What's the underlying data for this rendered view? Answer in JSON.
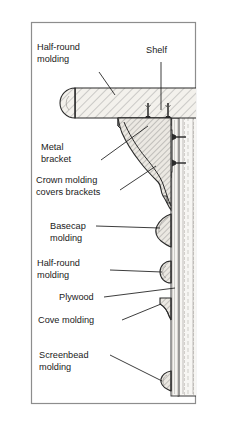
{
  "figure": {
    "type": "architectural-section-drawing",
    "border_color": "#8a8a8a",
    "background_color": "#ffffff",
    "line_color": "#1a1a1a",
    "hatch_color": "#4a4a4a",
    "wood_fill": "#f2f0ec",
    "wall_fill": "#f4f3f0"
  },
  "labels": [
    {
      "id": "half-round-molding-top",
      "line1": "Half-round",
      "line2": "molding"
    },
    {
      "id": "shelf",
      "line1": "Shelf",
      "line2": ""
    },
    {
      "id": "metal-bracket",
      "line1": "Metal",
      "line2": "bracket"
    },
    {
      "id": "crown-molding",
      "line1": "Crown molding",
      "line2": "covers brackets"
    },
    {
      "id": "basecap-molding",
      "line1": "Basecap",
      "line2": "molding"
    },
    {
      "id": "half-round-molding-lower",
      "line1": "Half-round",
      "line2": "molding"
    },
    {
      "id": "plywood",
      "line1": "Plywood",
      "line2": ""
    },
    {
      "id": "cove-molding",
      "line1": "Cove molding",
      "line2": ""
    },
    {
      "id": "screenbead-molding",
      "line1": "Screenbead",
      "line2": "molding"
    }
  ],
  "parts": [
    {
      "id": "shelf-board",
      "name": "Shelf"
    },
    {
      "id": "half-round-nosing",
      "name": "Half-round molding"
    },
    {
      "id": "metal-bracket-part",
      "name": "Metal bracket"
    },
    {
      "id": "crown-molding-part",
      "name": "Crown molding"
    },
    {
      "id": "basecap-molding-part",
      "name": "Basecap molding"
    },
    {
      "id": "half-round-lower-part",
      "name": "Half-round molding"
    },
    {
      "id": "plywood-panel",
      "name": "Plywood"
    },
    {
      "id": "cove-molding-part",
      "name": "Cove molding"
    },
    {
      "id": "screenbead-molding-part",
      "name": "Screenbead molding"
    },
    {
      "id": "wall-surface",
      "name": "Wall"
    },
    {
      "id": "fastener-1",
      "name": "Screw"
    },
    {
      "id": "fastener-2",
      "name": "Screw"
    },
    {
      "id": "bracket-screw-1",
      "name": "Bracket screw"
    },
    {
      "id": "bracket-screw-2",
      "name": "Bracket screw"
    }
  ]
}
